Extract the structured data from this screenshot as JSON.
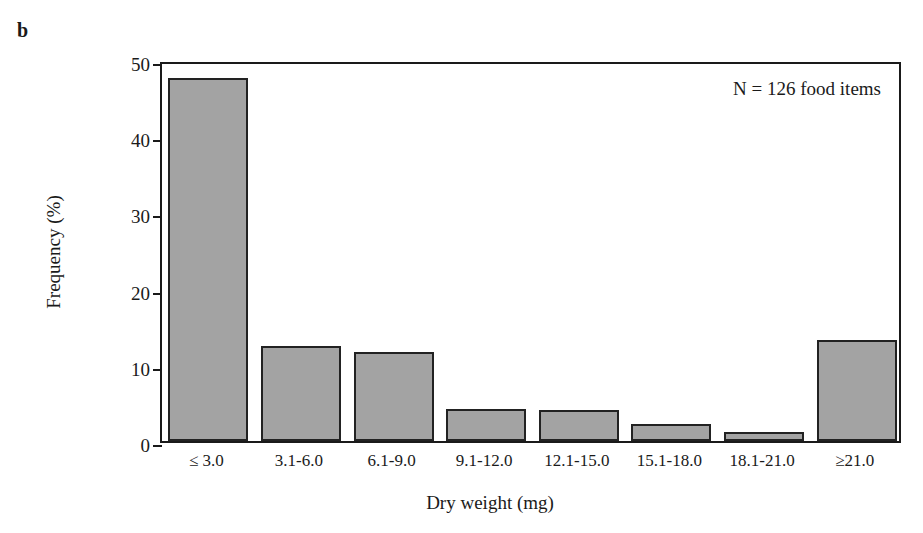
{
  "panel": {
    "label": "b"
  },
  "chart_data": {
    "type": "bar",
    "title": "",
    "subtitle": "",
    "categories": [
      "≤ 3.0",
      "3.1-6.0",
      "6.1-9.0",
      "9.1-12.0",
      "12.1-15.0",
      "15.1-18.0",
      "18.1-21.0",
      "≥21.0"
    ],
    "values": [
      47.6,
      12.5,
      11.7,
      4.2,
      4.1,
      2.2,
      1.2,
      13.2
    ],
    "xlabel": "Dry weight (mg)",
    "ylabel": "Frequency (%)",
    "ylim": [
      0,
      50
    ],
    "yticks": [
      0,
      10,
      20,
      30,
      40,
      50
    ],
    "ytick_labels": [
      "0",
      "10",
      "20",
      "30",
      "40",
      "50"
    ],
    "grid": false,
    "legend": null,
    "annotations": [
      {
        "text": "N = 126 food items",
        "position": "top-right"
      }
    ],
    "bar_fill_color": "#a3a3a3",
    "bar_edge_color": "#222222",
    "axis_color": "#1a1a1a"
  }
}
